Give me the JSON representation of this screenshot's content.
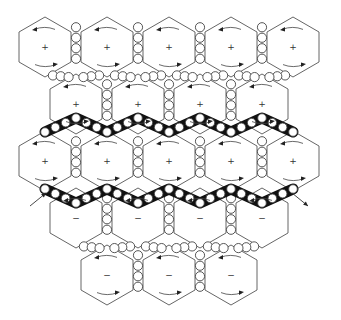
{
  "diagram": {
    "hex_radius": 30,
    "hex_half_width": 26,
    "colors": {
      "line": "#555555",
      "bead_fill": "#ffffff",
      "band": "#111111",
      "background": "#ffffff"
    },
    "rows": [
      {
        "y": 47,
        "sign": "+",
        "xs": [
          45,
          107,
          169,
          231,
          293
        ]
      },
      {
        "y": 104,
        "sign": "+",
        "xs": [
          76,
          138,
          200,
          262
        ]
      },
      {
        "y": 161,
        "sign": "+",
        "xs": [
          45,
          107,
          169,
          231,
          293
        ]
      },
      {
        "y": 218,
        "sign": "−",
        "xs": [
          76,
          138,
          200,
          262
        ]
      },
      {
        "y": 275,
        "sign": "−",
        "xs": [
          107,
          169,
          231
        ]
      }
    ],
    "signs": {
      "positive": "+",
      "negative": "−"
    },
    "dark_bands": [
      {
        "name": "upper-band",
        "points": [
          [
            45,
            132
          ],
          [
            76,
            118
          ],
          [
            107,
            132
          ],
          [
            138,
            118
          ],
          [
            169,
            132
          ],
          [
            200,
            118
          ],
          [
            231,
            132
          ],
          [
            262,
            118
          ],
          [
            293,
            132
          ]
        ]
      },
      {
        "name": "lower-band",
        "points": [
          [
            45,
            189
          ],
          [
            76,
            203
          ],
          [
            107,
            189
          ],
          [
            138,
            203
          ],
          [
            169,
            189
          ],
          [
            200,
            203
          ],
          [
            231,
            189
          ],
          [
            262,
            203
          ],
          [
            293,
            189
          ]
        ]
      }
    ],
    "side_arrows": [
      {
        "name": "left-inflow-arrow",
        "from": [
          30,
          206
        ],
        "to": [
          46,
          193
        ]
      },
      {
        "name": "right-outflow-arrow",
        "from": [
          292,
          193
        ],
        "to": [
          308,
          206
        ]
      }
    ]
  }
}
